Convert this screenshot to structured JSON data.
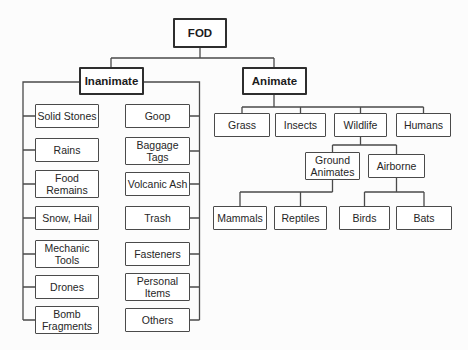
{
  "tree": {
    "root": {
      "label": "FOD"
    },
    "inanimate": {
      "label": "Inanimate",
      "col1": [
        "Solid Stones",
        "Rains",
        "Food\nRemains",
        "Snow, Hail",
        "Mechanic\nTools",
        "Drones",
        "Bomb\nFragments"
      ],
      "col2": [
        "Goop",
        "Baggage\nTags",
        "Volcanic Ash",
        "Trash",
        "Fasteners",
        "Personal\nItems",
        "Others"
      ]
    },
    "animate": {
      "label": "Animate",
      "children": [
        "Grass",
        "Insects",
        "Wildlife",
        "Humans"
      ],
      "wildlife": {
        "children": [
          "Ground\nAnimates",
          "Airborne"
        ],
        "ground_animates": {
          "children": [
            "Mammals",
            "Reptiles"
          ]
        },
        "airborne": {
          "children": [
            "Birds",
            "Bats"
          ]
        }
      }
    }
  },
  "colors": {
    "line": "#4a4a4a",
    "box_border": "#4a4a4a",
    "bold_border": "#2e2e2e",
    "text": "#262626",
    "background": "#fcfcfc"
  }
}
